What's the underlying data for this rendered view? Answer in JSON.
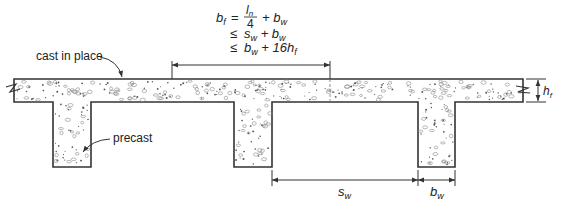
{
  "labels": {
    "cast_in_place": "cast in place",
    "precast": "precast"
  },
  "formula": {
    "lhs": "b",
    "lhs_sub": "f",
    "eq": "=",
    "frac_num": "l",
    "frac_num_sub": "n",
    "frac_den": "4",
    "line1_tail": "+ b",
    "line1_tail_sub": "w",
    "leq": "≤",
    "line2_a": "s",
    "line2_a_sub": "w",
    "line2_b": "+ b",
    "line2_b_sub": "w",
    "line3_a": "b",
    "line3_a_sub": "w",
    "line3_b": "+ 16h",
    "line3_b_sub": "f"
  },
  "dimensions": {
    "hf": {
      "main": "h",
      "sub": "f"
    },
    "sw": {
      "main": "s",
      "sub": "w"
    },
    "bw": {
      "main": "b",
      "sub": "w"
    }
  },
  "colors": {
    "line": "#333333",
    "fill": "#ffffff",
    "aggregate": "#555555"
  }
}
